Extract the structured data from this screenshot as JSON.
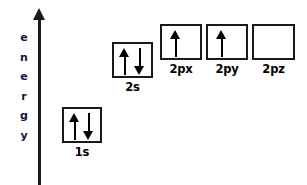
{
  "diagram": {
    "background_color": "#ffffff",
    "line_color": "#1a1a1a",
    "axis": {
      "name": "energy-axis",
      "label_text": "energy",
      "label_color": "#12123a",
      "letters": [
        "e",
        "n",
        "e",
        "r",
        "g",
        "y"
      ],
      "direction": "up"
    },
    "orbitals": [
      {
        "id": "1s",
        "label": "1s",
        "electrons": [
          "up",
          "down"
        ],
        "x": 62,
        "y": 107,
        "width": 40,
        "height": 36
      },
      {
        "id": "2s",
        "label": "2s",
        "electrons": [
          "up",
          "down"
        ],
        "x": 112,
        "y": 42,
        "width": 41,
        "height": 36
      },
      {
        "id": "2px",
        "label": "2px",
        "electrons": [
          "up"
        ],
        "x": 160,
        "y": 24,
        "width": 42,
        "height": 36
      },
      {
        "id": "2py",
        "label": "2py",
        "electrons": [
          "up"
        ],
        "x": 206,
        "y": 24,
        "width": 42,
        "height": 36
      },
      {
        "id": "2pz",
        "label": "2pz",
        "electrons": [],
        "x": 252,
        "y": 24,
        "width": 43,
        "height": 36
      }
    ]
  }
}
